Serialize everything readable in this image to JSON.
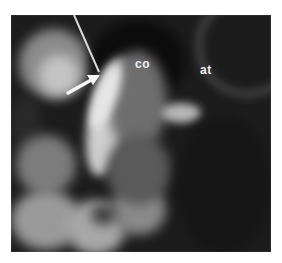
{
  "figure": {
    "type": "radiograph",
    "labels": [
      {
        "id": "co",
        "text": "co",
        "x": 135,
        "y": 58
      },
      {
        "id": "at",
        "text": "at",
        "x": 200,
        "y": 64
      }
    ],
    "arrow": {
      "from": [
        68,
        93
      ],
      "to": [
        100,
        75
      ],
      "color": "#f5f5f5"
    },
    "needle": {
      "from": [
        74,
        15
      ],
      "to": [
        99,
        72
      ],
      "color": "#d8d8d8"
    },
    "colors": {
      "background": "#1c1c1c",
      "bone_highlight": "#e6e6e6",
      "mid_gray": "#7a7a7a"
    }
  }
}
